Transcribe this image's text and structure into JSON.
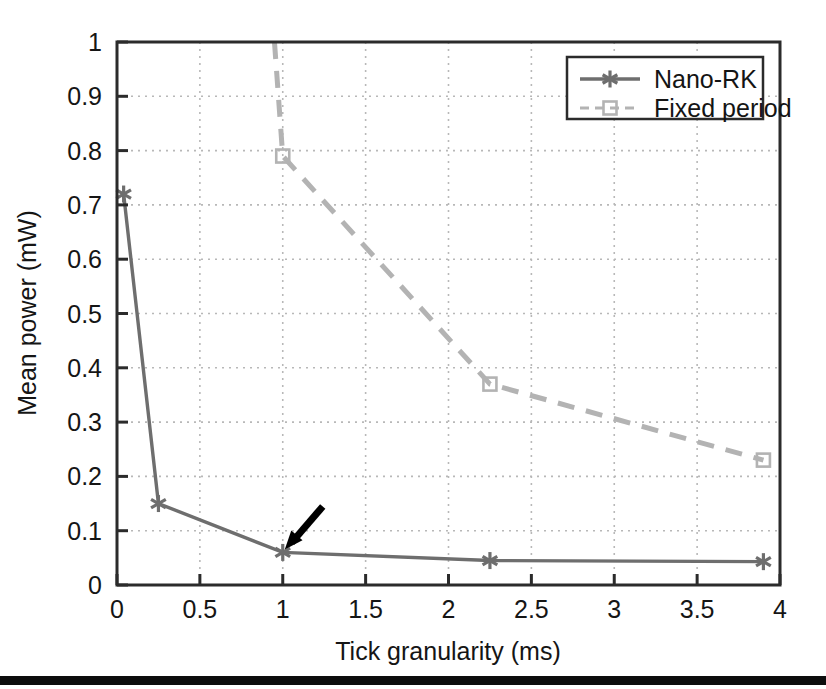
{
  "figure": {
    "background_color": "#ffffff",
    "bottom_rule_color": "#0d0d0d"
  },
  "chart_data": {
    "type": "line",
    "title": "",
    "xlabel": "Tick granularity (ms)",
    "ylabel": "Mean power (mW)",
    "xlim": [
      0,
      4
    ],
    "ylim": [
      0,
      1
    ],
    "xticks": [
      0,
      0.5,
      1,
      1.5,
      2,
      2.5,
      3,
      3.5,
      4
    ],
    "xtick_labels": [
      "0",
      "0.5",
      "1",
      "1.5",
      "2",
      "2.5",
      "3",
      "3.5",
      "4"
    ],
    "yticks": [
      0,
      0.1,
      0.2,
      0.3,
      0.4,
      0.5,
      0.6,
      0.7,
      0.8,
      0.9,
      1
    ],
    "ytick_labels": [
      "0",
      "0.1",
      "0.2",
      "0.3",
      "0.4",
      "0.5",
      "0.6",
      "0.7",
      "0.8",
      "0.9",
      "1"
    ],
    "grid": true,
    "grid_style": "dotted",
    "legend_position": "top-right",
    "series": [
      {
        "name": "Nano-RK",
        "color": "#6e6e6e",
        "linestyle": "solid",
        "marker": "asterisk",
        "x": [
          0.04,
          0.25,
          1.0,
          2.25,
          3.9
        ],
        "values": [
          0.72,
          0.15,
          0.06,
          0.045,
          0.043
        ]
      },
      {
        "name": "Fixed period",
        "color": "#b3b3b3",
        "linestyle": "dashed",
        "marker": "square",
        "x": [
          0.95,
          1.0,
          2.25,
          3.9
        ],
        "values": [
          1.0,
          0.79,
          0.37,
          0.23
        ]
      }
    ],
    "annotations": [
      {
        "type": "arrow",
        "name": "nano-rk-highlight-arrow",
        "points_to_x": 1.0,
        "points_to_y": 0.06,
        "color": "#000000"
      }
    ]
  },
  "legend": {
    "entries": [
      {
        "label": "Nano-RK"
      },
      {
        "label": "Fixed period"
      }
    ]
  }
}
